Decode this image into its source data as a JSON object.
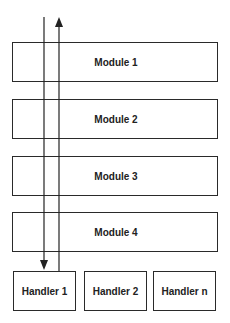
{
  "diagram": {
    "modules": [
      {
        "label": "Module 1"
      },
      {
        "label": "Module 2"
      },
      {
        "label": "Module 3"
      },
      {
        "label": "Module 4"
      }
    ],
    "handlers": [
      {
        "label": "Handler 1"
      },
      {
        "label": "Handler 2"
      },
      {
        "label": "Handler n"
      }
    ],
    "arrows": [
      {
        "direction": "down",
        "from": "top",
        "to": "Handler 1"
      },
      {
        "direction": "up",
        "from": "Handler 1",
        "to": "top"
      }
    ]
  }
}
